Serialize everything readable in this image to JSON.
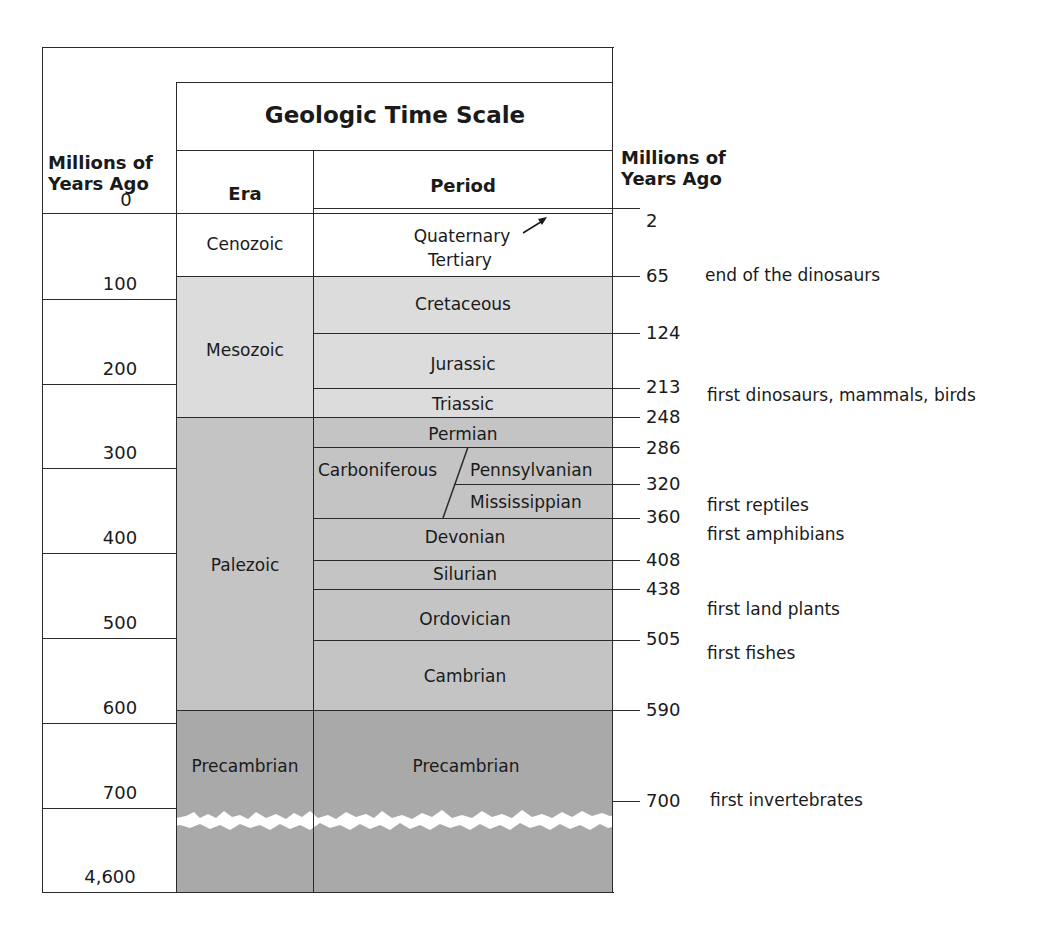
{
  "title": "Geologic Time Scale",
  "left_axis": {
    "header_line1": "Millions of",
    "header_line2": "Years Ago",
    "zero": "0",
    "ticks": [
      "100",
      "200",
      "300",
      "400",
      "500",
      "600",
      "700",
      "4,600"
    ]
  },
  "right_axis": {
    "header_line1": "Millions of",
    "header_line2": "Years Ago",
    "ticks": [
      "2",
      "65",
      "124",
      "213",
      "248",
      "286",
      "320",
      "360",
      "408",
      "438",
      "505",
      "590",
      "700"
    ]
  },
  "columns": {
    "era": "Era",
    "period": "Period"
  },
  "eras": [
    "Cenozoic",
    "Mesozoic",
    "Palezoic",
    "Precambrian"
  ],
  "periods": {
    "quaternary": "Quaternary",
    "tertiary": "Tertiary",
    "cretaceous": "Cretaceous",
    "jurassic": "Jurassic",
    "triassic": "Triassic",
    "permian": "Permian",
    "carboniferous": "Carboniferous",
    "pennsylvanian": "Pennsylvanian",
    "mississippian": "Mississippian",
    "devonian": "Devonian",
    "silurian": "Silurian",
    "ordovician": "Ordovician",
    "cambrian": "Cambrian",
    "precambrian": "Precambrian"
  },
  "events": {
    "e65": "end of the dinosaurs",
    "e213": "first dinosaurs, mammals, birds",
    "e_reptiles": "first reptiles",
    "e_amphibians": "first amphibians",
    "e_land_plants": "first land plants",
    "e_fishes": "first fishes",
    "e700": "first invertebrates"
  },
  "colors": {
    "cenozoic": "#ffffff",
    "mesozoic": "#dcdcdc",
    "paleozoic": "#c4c4c4",
    "precambrian": "#a9a9a9",
    "lines": "#2a2a2a"
  }
}
